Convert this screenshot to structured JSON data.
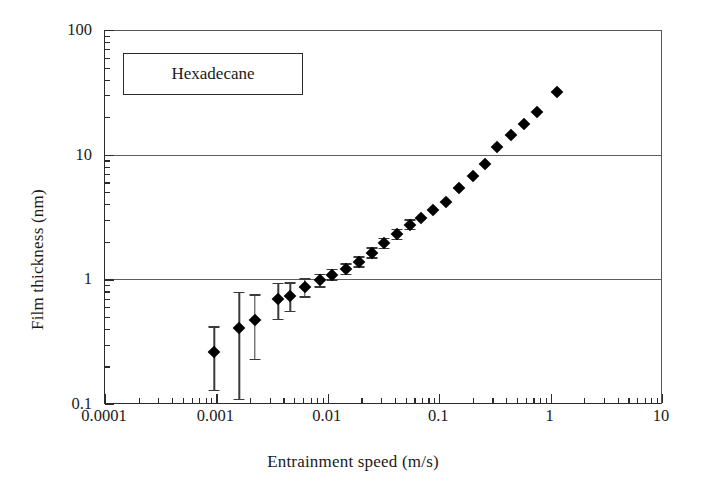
{
  "chart_data": {
    "type": "scatter",
    "title": "",
    "xlabel": "Entrainment speed (m/s)",
    "ylabel": "Film thickness (nm)",
    "xscale": "log",
    "yscale": "log",
    "xlim": [
      0.0001,
      10
    ],
    "ylim": [
      0.1,
      100
    ],
    "grid": "horizontal-major-only",
    "legend_position": "top-left",
    "annotation": "Hexadecane",
    "xticks": [
      "0.0001",
      "0.001",
      "0.01",
      "0.1",
      "1",
      "10"
    ],
    "xtick_values": [
      0.0001,
      0.001,
      0.01,
      0.1,
      1,
      10
    ],
    "yticks": [
      "0.1",
      "1",
      "10",
      "100"
    ],
    "ytick_values": [
      0.1,
      1,
      10,
      100
    ],
    "gridline_values": [
      1,
      10
    ],
    "marker": "filled-diamond",
    "marker_color": "#000000",
    "errorbar_color": "#3a3a3a",
    "series": [
      {
        "name": "Hexadecane",
        "x": [
          0.00096,
          0.0016,
          0.0022,
          0.0036,
          0.0046,
          0.0062,
          0.0085,
          0.011,
          0.0145,
          0.019,
          0.025,
          0.032,
          0.042,
          0.055,
          0.068,
          0.088,
          0.115,
          0.15,
          0.2,
          0.26,
          0.33,
          0.44,
          0.58,
          0.76,
          1.15
        ],
        "y": [
          0.26,
          0.41,
          0.47,
          0.7,
          0.74,
          0.86,
          0.98,
          1.09,
          1.21,
          1.38,
          1.63,
          1.95,
          2.3,
          2.75,
          3.1,
          3.6,
          4.2,
          5.4,
          6.8,
          8.4,
          11.5,
          14.5,
          17.5,
          22.0,
          32.0
        ],
        "yerr_low": [
          0.13,
          0.3,
          0.24,
          0.22,
          0.18,
          0.13,
          0.1,
          0.09,
          0.1,
          0.11,
          0.13,
          0.15,
          0.18,
          0.2,
          0.0,
          0.0,
          0.0,
          0.0,
          0.0,
          0.0,
          0.0,
          0.0,
          0.0,
          0.0,
          0.0
        ],
        "yerr_high": [
          0.16,
          0.38,
          0.29,
          0.24,
          0.21,
          0.16,
          0.13,
          0.12,
          0.13,
          0.15,
          0.18,
          0.21,
          0.24,
          0.28,
          0.0,
          0.0,
          0.0,
          0.0,
          0.0,
          0.0,
          0.0,
          0.0,
          0.0,
          0.0,
          0.0
        ]
      }
    ]
  },
  "legend": {
    "label": "Hexadecane"
  },
  "axes": {
    "x_title": "Entrainment speed (m/s)",
    "y_title": "Film thickness (nm)"
  }
}
